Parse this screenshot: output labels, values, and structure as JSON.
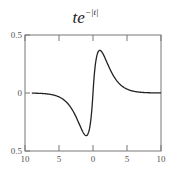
{
  "chart_data": {
    "type": "line",
    "title_base": "te",
    "title_exponent": "−|t|",
    "xlabel": "",
    "ylabel": "",
    "xlim": [
      -10,
      10
    ],
    "ylim": [
      -0.5,
      0.5
    ],
    "x_ticks": [
      -10,
      -5,
      0,
      5,
      10
    ],
    "x_tick_labels": [
      "10",
      "5",
      "0",
      "5",
      "10"
    ],
    "y_ticks": [
      0.5,
      0,
      -0.5
    ],
    "y_tick_labels": [
      "0.5",
      "0",
      "0.5"
    ],
    "grid": false,
    "legend": null,
    "series": [
      {
        "name": "te^{-|t|}",
        "color": "#222222",
        "x": [
          -9,
          -8,
          -7,
          -6,
          -5,
          -4,
          -3.5,
          -3,
          -2.5,
          -2,
          -1.5,
          -1,
          -0.5,
          0,
          0.5,
          1,
          1.5,
          2,
          2.5,
          3,
          3.5,
          4,
          5,
          6,
          7,
          8,
          9,
          10
        ],
        "values": [
          -0.001,
          -0.003,
          -0.006,
          -0.015,
          -0.034,
          -0.073,
          -0.106,
          -0.149,
          -0.205,
          -0.271,
          -0.335,
          -0.368,
          -0.303,
          0.0,
          0.303,
          0.368,
          0.335,
          0.271,
          0.205,
          0.149,
          0.106,
          0.073,
          0.034,
          0.015,
          0.006,
          0.003,
          0.001,
          0.0005
        ]
      }
    ]
  },
  "plot": {
    "frame": {
      "left": 25,
      "top": 35,
      "right": 161,
      "bottom": 151
    },
    "axis_color": "#777777"
  }
}
